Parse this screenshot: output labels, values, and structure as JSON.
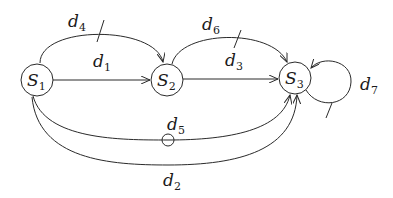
{
  "diagram": {
    "nodes": [
      {
        "id": "S1",
        "base": "S",
        "sub": "1"
      },
      {
        "id": "S2",
        "base": "S",
        "sub": "2"
      },
      {
        "id": "S3",
        "base": "S",
        "sub": "3"
      }
    ],
    "edges": [
      {
        "id": "d1",
        "base": "d",
        "sub": "1",
        "from": "S1",
        "to": "S2",
        "marker": "none"
      },
      {
        "id": "d2",
        "base": "d",
        "sub": "2",
        "from": "S1",
        "to": "S3",
        "marker": "none"
      },
      {
        "id": "d3",
        "base": "d",
        "sub": "3",
        "from": "S2",
        "to": "S3",
        "marker": "none"
      },
      {
        "id": "d4",
        "base": "d",
        "sub": "4",
        "from": "S1",
        "to": "S2",
        "marker": "tick"
      },
      {
        "id": "d5",
        "base": "d",
        "sub": "5",
        "from": "S1",
        "to": "S3",
        "marker": "circle"
      },
      {
        "id": "d6",
        "base": "d",
        "sub": "6",
        "from": "S2",
        "to": "S3",
        "marker": "tick"
      },
      {
        "id": "d7",
        "base": "d",
        "sub": "7",
        "from": "S3",
        "to": "S3",
        "marker": "tick"
      }
    ],
    "colors": {
      "stroke": "#2a2a2a",
      "background": "#ffffff"
    }
  }
}
